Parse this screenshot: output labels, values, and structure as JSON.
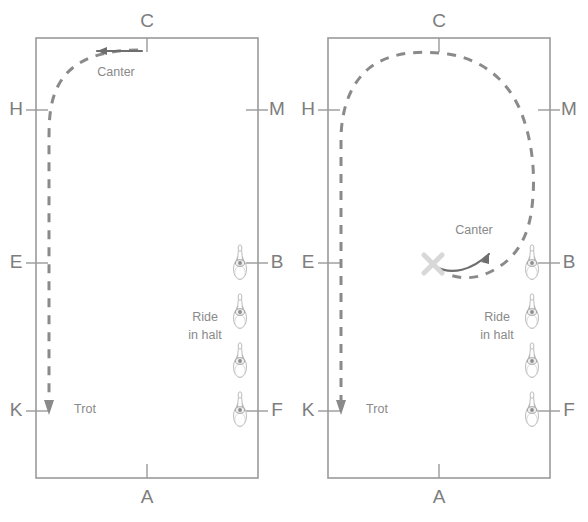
{
  "figure": {
    "width": 588,
    "height": 522,
    "background": "#ffffff",
    "arena_stroke": "#9a9a9a",
    "path_stroke": "#8a8a8a",
    "arrow_stroke": "#6e6e6e",
    "text_color": "#7d7d7d",
    "x_marker_color": "#d8d8d8",
    "horse_color": "#b8b8b8"
  },
  "panels": [
    {
      "id": "left-arena",
      "name": "left-dressage-arena",
      "rect": {
        "x": 36,
        "y": 38,
        "w": 222,
        "h": 440
      },
      "letters": [
        {
          "id": "C",
          "label": "C",
          "side": "top",
          "tx": 147,
          "ty": 22,
          "mx": 147,
          "my": 38,
          "m2x": 147,
          "m2y": 52
        },
        {
          "id": "A",
          "label": "A",
          "side": "bottom",
          "tx": 147,
          "ty": 498,
          "mx": 147,
          "my": 478,
          "m2x": 147,
          "m2y": 464
        },
        {
          "id": "H",
          "label": "H",
          "side": "left",
          "tx": 16,
          "ty": 110,
          "mx": 26,
          "my": 110,
          "m2x": 48,
          "m2y": 110
        },
        {
          "id": "E",
          "label": "E",
          "side": "left",
          "tx": 16,
          "ty": 263,
          "mx": 26,
          "my": 263,
          "m2x": 48,
          "m2y": 263
        },
        {
          "id": "K",
          "label": "K",
          "side": "left",
          "tx": 16,
          "ty": 411,
          "mx": 26,
          "my": 411,
          "m2x": 48,
          "m2y": 411
        },
        {
          "id": "M",
          "label": "M",
          "side": "right",
          "tx": 277,
          "ty": 110,
          "mx": 268,
          "my": 110,
          "m2x": 246,
          "m2y": 110
        },
        {
          "id": "B",
          "label": "B",
          "side": "right",
          "tx": 277,
          "ty": 263,
          "mx": 268,
          "my": 263,
          "m2x": 246,
          "m2y": 263
        },
        {
          "id": "F",
          "label": "F",
          "side": "right",
          "tx": 277,
          "ty": 411,
          "mx": 268,
          "my": 411,
          "m2x": 246,
          "m2y": 411
        }
      ],
      "dashed_path": "M 138 50 C 105 50 72 58 58 86 C 50 102 49 118 49 140 L 49 404",
      "gait_labels": [
        {
          "id": "canter",
          "label": "Canter",
          "x": 116,
          "y": 73
        },
        {
          "id": "trot",
          "label": "Trot",
          "x": 85,
          "y": 410
        }
      ],
      "solid_arrows": [
        {
          "id": "canter-arrow",
          "path": "M 142 51 L 97 51",
          "head": "M 97 51 L 107 47 L 107 55 Z"
        }
      ],
      "path_arrowheads": [
        {
          "id": "trot-arrowhead",
          "path": "M 49 415 L 44 400 L 54 400 Z"
        }
      ],
      "x_marker": null,
      "halt_label": {
        "id": "ride-in-halt",
        "line1": "Ride",
        "line2": "in halt",
        "x": 205,
        "y1": 318,
        "y2": 336
      },
      "horses": [
        {
          "id": "horse-1",
          "x": 240,
          "y": 264
        },
        {
          "id": "horse-2",
          "x": 240,
          "y": 313
        },
        {
          "id": "horse-3",
          "x": 240,
          "y": 362
        },
        {
          "id": "horse-4",
          "x": 240,
          "y": 411
        }
      ]
    },
    {
      "id": "right-arena",
      "name": "right-dressage-arena",
      "rect": {
        "x": 328,
        "y": 38,
        "w": 222,
        "h": 440
      },
      "letters": [
        {
          "id": "C",
          "label": "C",
          "side": "top",
          "tx": 439,
          "ty": 22,
          "mx": 439,
          "my": 38,
          "m2x": 439,
          "m2y": 52
        },
        {
          "id": "A",
          "label": "A",
          "side": "bottom",
          "tx": 439,
          "ty": 498,
          "mx": 439,
          "my": 478,
          "m2x": 439,
          "m2y": 464
        },
        {
          "id": "H",
          "label": "H",
          "side": "left",
          "tx": 308,
          "ty": 110,
          "mx": 318,
          "my": 110,
          "m2x": 340,
          "m2y": 110
        },
        {
          "id": "E",
          "label": "E",
          "side": "left",
          "tx": 308,
          "ty": 263,
          "mx": 318,
          "my": 263,
          "m2x": 340,
          "m2y": 263
        },
        {
          "id": "K",
          "label": "K",
          "side": "left",
          "tx": 308,
          "ty": 411,
          "mx": 318,
          "my": 411,
          "m2x": 340,
          "m2y": 411
        },
        {
          "id": "M",
          "label": "M",
          "side": "right",
          "tx": 569,
          "ty": 110,
          "mx": 560,
          "my": 110,
          "m2x": 538,
          "m2y": 110
        },
        {
          "id": "B",
          "label": "B",
          "side": "right",
          "tx": 569,
          "ty": 263,
          "mx": 560,
          "my": 263,
          "m2x": 538,
          "m2y": 263
        },
        {
          "id": "F",
          "label": "F",
          "side": "right",
          "tx": 569,
          "ty": 411,
          "mx": 560,
          "my": 411,
          "m2x": 538,
          "m2y": 411
        }
      ],
      "dashed_path": "M 341 404 L 341 140 C 341 112 349 86 367 70 C 388 52 418 50 448 54 C 482 59 508 80 521 112 C 534 145 536 182 531 214 C 526 244 511 262 490 272 C 476 279 462 279 450 275",
      "gait_labels": [
        {
          "id": "canter",
          "label": "Canter",
          "x": 474,
          "y": 231
        },
        {
          "id": "trot",
          "label": "Trot",
          "x": 377,
          "y": 410
        }
      ],
      "solid_arrows": [
        {
          "id": "canter-arrow",
          "path": "M 434 266 C 452 276 472 270 489 254",
          "head": "M 489 254 L 481 262 L 489 264 Z"
        }
      ],
      "path_arrowheads": [
        {
          "id": "trot-arrowhead",
          "path": "M 341 415 L 336 400 L 346 400 Z"
        }
      ],
      "x_marker": {
        "id": "x-marker",
        "cx": 433,
        "cy": 264,
        "r": 9
      },
      "halt_label": {
        "id": "ride-in-halt",
        "line1": "Ride",
        "line2": "in halt",
        "x": 497,
        "y1": 318,
        "y2": 336
      },
      "horses": [
        {
          "id": "horse-1",
          "x": 532,
          "y": 264
        },
        {
          "id": "horse-2",
          "x": 532,
          "y": 313
        },
        {
          "id": "horse-3",
          "x": 532,
          "y": 362
        },
        {
          "id": "horse-4",
          "x": 532,
          "y": 411
        }
      ]
    }
  ]
}
